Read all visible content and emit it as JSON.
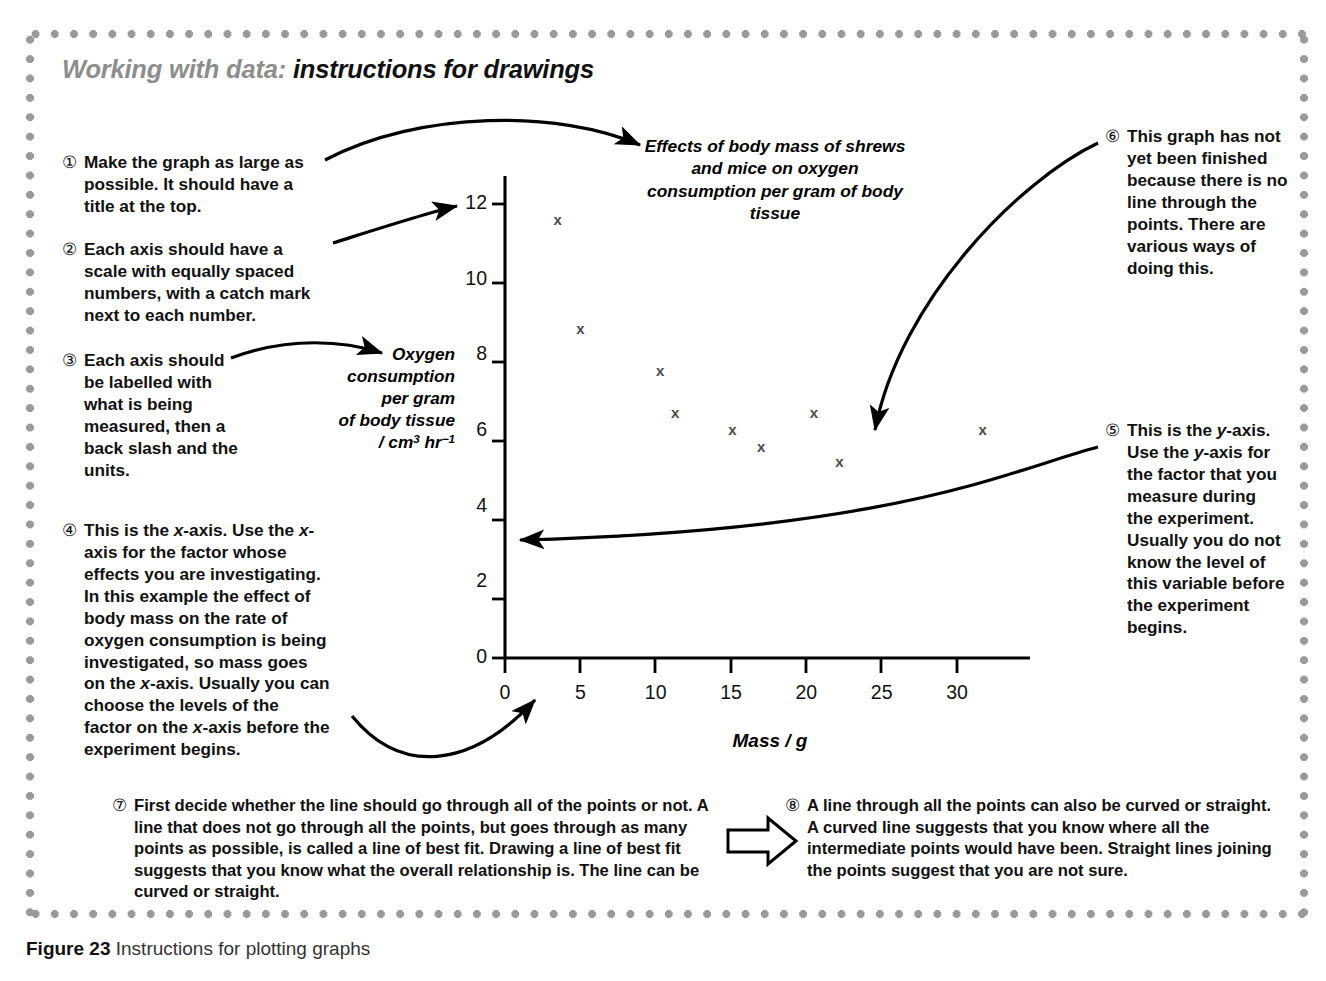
{
  "panel": {
    "heading_lead": "Working with data:",
    "heading_rest": "instructions for drawings"
  },
  "notes": [
    {
      "num": "①",
      "text": "Make the graph as large as possible. It should have a title at the top."
    },
    {
      "num": "②",
      "text": "Each axis should have a scale with equally spaced numbers, with a catch mark next to each number."
    },
    {
      "num": "③",
      "text": "Each axis should be labelled with what is being measured, then a back slash and the units."
    },
    {
      "num": "④",
      "text": "This is the x-axis. Use the x-axis for the factor whose effects you are investigating. In this example the effect of body mass on the rate of oxygen consumption is being investigated, so mass goes on the x-axis. Usually you can choose the levels of the factor on the x-axis before the experiment begins."
    },
    {
      "num": "⑤",
      "text": "This is the y-axis. Use the y-axis for the factor that you measure during the experiment. Usually you do not know the level of this variable before the experiment begins."
    },
    {
      "num": "⑥",
      "text": "This graph has not yet been finished because there is no line through the points. There are various ways of doing this."
    },
    {
      "num": "⑦",
      "text": "First decide whether the line should go through all of the points or not. A line that does not go through all the points, but goes through as many points as possible, is called a line of best fit. Drawing a line of best fit suggests that you know what the overall relationship is. The line can be curved or straight."
    },
    {
      "num": "⑧",
      "text": "A line through all the points can also be curved or straight. A curved line suggests that you know where all the intermediate points would have been. Straight lines joining the points suggest that you are not sure."
    }
  ],
  "caption": {
    "label": "Figure 23",
    "text": "Instructions for plotting graphs"
  },
  "chart_data": {
    "type": "scatter",
    "title": "Effects of body mass of shrews and mice on oxygen consumption per gram of body tissue",
    "xlabel": "Mass / g",
    "ylabel": "Oxygen consumption per gram of body tissue / cm3 hr-1",
    "ylabel_lines": [
      "Oxygen",
      "consumption",
      "per gram",
      "of body tissue",
      "/ cm",
      " hr"
    ],
    "ylabel_units_numerator": "cm",
    "ylabel_units_sup1": "3",
    "ylabel_units_hr": "hr",
    "ylabel_units_sup2": "−1",
    "xlim": [
      0,
      34.5
    ],
    "ylim": [
      0,
      13
    ],
    "xticks": [
      0,
      5,
      10,
      15,
      20,
      25,
      30
    ],
    "yticks": [
      0,
      2,
      4,
      6,
      8,
      10,
      12
    ],
    "grid": false,
    "legend": "none",
    "marker": "x",
    "marker_color": "#4a4a4a",
    "points": [
      {
        "x": 3.5,
        "y": 11.6
      },
      {
        "x": 5.0,
        "y": 8.7
      },
      {
        "x": 10.3,
        "y": 7.6
      },
      {
        "x": 11.3,
        "y": 6.5
      },
      {
        "x": 15.1,
        "y": 6.05
      },
      {
        "x": 17.0,
        "y": 5.6
      },
      {
        "x": 20.5,
        "y": 6.5
      },
      {
        "x": 22.2,
        "y": 5.2
      },
      {
        "x": 31.7,
        "y": 6.05
      }
    ]
  },
  "colors": {
    "frame_dots": "#9a9a9a",
    "heading_gray": "#8d8d8d",
    "axis": "#000000"
  }
}
